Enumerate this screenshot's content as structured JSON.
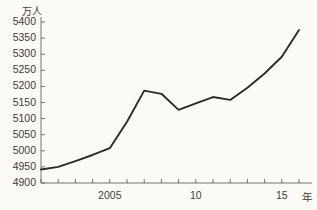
{
  "chart_data": {
    "type": "line",
    "title": "",
    "subtitle": "",
    "xlabel": "年",
    "ylabel": "万人",
    "ylim": [
      4900,
      5400
    ],
    "xlim": [
      2001,
      2016
    ],
    "grid": false,
    "legend": "none",
    "x": [
      2001,
      2002,
      2003,
      2004,
      2005,
      2006,
      2007,
      2008,
      2009,
      2010,
      2011,
      2012,
      2013,
      2014,
      2015,
      2016
    ],
    "values": [
      4942,
      4950,
      4968,
      4987,
      5008,
      5090,
      5187,
      5177,
      5127,
      5147,
      5167,
      5158,
      5196,
      5240,
      5292,
      5375
    ],
    "series": [
      {
        "name": "人口",
        "values": [
          4942,
          4950,
          4968,
          4987,
          5008,
          5090,
          5187,
          5177,
          5127,
          5147,
          5167,
          5158,
          5196,
          5240,
          5292,
          5375
        ]
      }
    ],
    "y_ticks": [
      4900,
      4950,
      5000,
      5050,
      5100,
      5150,
      5200,
      5250,
      5300,
      5350,
      5400
    ],
    "y_tick_labels": [
      "4900",
      "4950",
      "5000",
      "5050",
      "5100",
      "5150",
      "5200",
      "5250",
      "5300",
      "5350",
      "5400"
    ],
    "x_ticks": [
      2001,
      2002,
      2003,
      2004,
      2005,
      2006,
      2007,
      2008,
      2009,
      2010,
      2011,
      2012,
      2013,
      2014,
      2015,
      2016
    ],
    "x_tick_labels": [
      {
        "value": 2005,
        "label": "2005"
      },
      {
        "value": 2010,
        "label": "10"
      },
      {
        "value": 2015,
        "label": "15"
      }
    ],
    "annotations": [],
    "line_color": "#2b2b28",
    "axis_color": "#6b6257",
    "text_color": "#453c33",
    "background_color": "#fbfaf6"
  },
  "axes": {
    "y_unit_label": "万人",
    "x_unit_label": "年"
  }
}
